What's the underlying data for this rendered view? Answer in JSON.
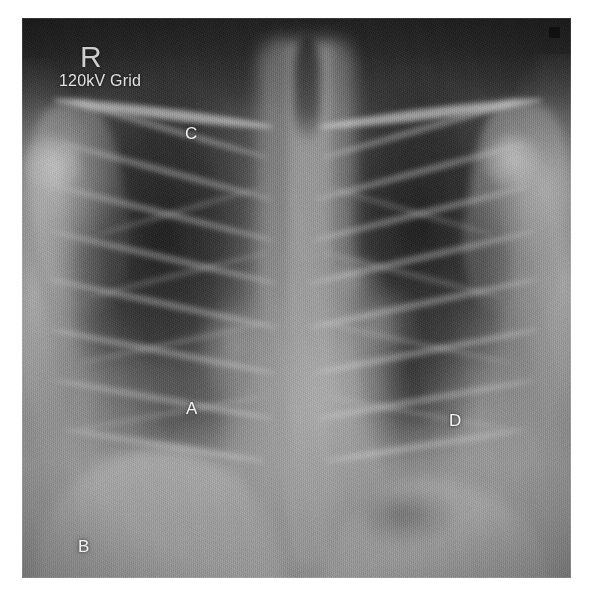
{
  "image": {
    "modality": "chest-radiograph",
    "view": "PA",
    "plate": {
      "left": 22,
      "top": 18,
      "width": 549,
      "height": 560
    },
    "background_color": "#ffffff",
    "film_dark_color": "#1d1d1d",
    "film_mid_color": "#6d6d6d",
    "film_light_color": "#8e8e8e"
  },
  "overlay": {
    "side_marker": "R",
    "exposure_text": "120kV Grid",
    "marker_color": "#cfcfcf",
    "text_color": "#e2e2e2",
    "annotation_color": "#f2f2f2"
  },
  "annotations": [
    {
      "label": "A",
      "x": 164,
      "y": 382,
      "target": "right-hilum"
    },
    {
      "label": "B",
      "x": 56,
      "y": 520,
      "target": "right-costophrenic-angle"
    },
    {
      "label": "C",
      "x": 163,
      "y": 107,
      "target": "right-upper-zone"
    },
    {
      "label": "D",
      "x": 427,
      "y": 394,
      "target": "left-lower-zone"
    }
  ],
  "corner_marker": {
    "present": true,
    "color": "#101010",
    "size": 11
  },
  "anatomy": [
    {
      "name": "right-lung-field",
      "kind": "lucency"
    },
    {
      "name": "left-lung-field",
      "kind": "lucency"
    },
    {
      "name": "mediastinum",
      "kind": "density"
    },
    {
      "name": "thoracic-spine",
      "kind": "density"
    },
    {
      "name": "trachea",
      "kind": "lucency"
    },
    {
      "name": "cardiac-silhouette",
      "kind": "density"
    },
    {
      "name": "aortic-knob",
      "kind": "density"
    },
    {
      "name": "right-hemidiaphragm",
      "kind": "density"
    },
    {
      "name": "left-hemidiaphragm",
      "kind": "density"
    },
    {
      "name": "gastric-bubble",
      "kind": "lucency"
    },
    {
      "name": "right-clavicle",
      "kind": "bone"
    },
    {
      "name": "left-clavicle",
      "kind": "bone"
    },
    {
      "name": "ribs",
      "kind": "bone"
    },
    {
      "name": "scapulae",
      "kind": "bone"
    },
    {
      "name": "humeral-heads",
      "kind": "bone"
    }
  ]
}
